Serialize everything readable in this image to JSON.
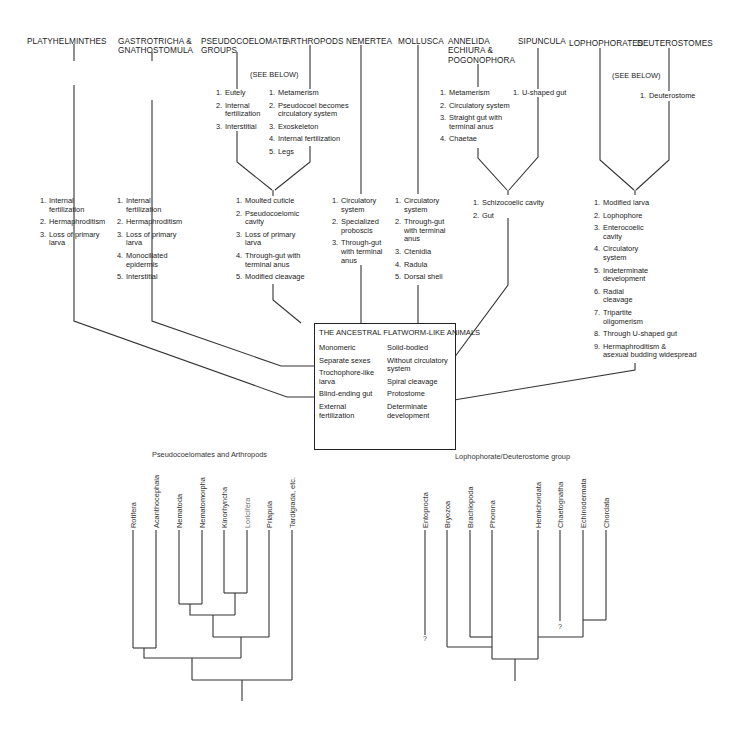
{
  "headers": {
    "platyhelminthes": "PLATYHELMINTHES",
    "gastrotricha": "GASTROTRICHA &\nGNATHOSTOMULA",
    "pseudocoelomate": "PSEUDOCOELOMATE\nGROUPS",
    "arthropods": "ARTHROPODS",
    "nemertea": "NEMERTEA",
    "mollusca": "MOLLUSCA",
    "annelida": "ANNELIDA\nECHIURA &\nPOGONOPHORA",
    "sipuncula": "SIPUNCULA",
    "lophophorates": "LOPHOPHORATES",
    "deuterostomes": "DEUTEROSTOMES"
  },
  "see_below_1": "(SEE BELOW)",
  "see_below_2": "(SEE BELOW)",
  "lists": {
    "pseudocoelomate": [
      "Eutely",
      "Internal\nfertilization",
      "Interstitial"
    ],
    "arthropods": [
      "Metamerism",
      "Pseudocoel becomes\ncirculatory system",
      "Exoskeleton",
      "Internal fertilization",
      "Legs"
    ],
    "annelida": [
      "Metamerism",
      "Circulatory system",
      "Straight gut with\nterminal anus",
      "Chaetae"
    ],
    "sipuncula": [
      "U-shaped gut"
    ],
    "deuterostomes": [
      "Deuterostome"
    ],
    "platyhelminthes": [
      "Internal\nfertilization",
      "Hermaphroditism",
      "Loss of primary\nlarva"
    ],
    "gastrotricha": [
      "Internal\nfertilization",
      "Hermaphroditism",
      "Loss of primary\nlarva",
      "Monociliated\nepidermis",
      "Interstitial"
    ],
    "pseudo_arthro_joint": [
      "Moulted cuticle",
      "Pseudocoelomic\ncavity",
      "Loss of primary\nlarva",
      "Through-gut with\nterminal anus",
      "Modified cleavage"
    ],
    "nemertea": [
      "Circulatory\nsystem",
      "Specialized\nproboscis",
      "Through-gut\nwith terminal\nanus"
    ],
    "mollusca": [
      "Circulatory\nsystem",
      "Through-gut\nwith terminal\nanus",
      "Ctenidia",
      "Radula",
      "Dorsal shell"
    ],
    "annelid_sipuncula_joint": [
      "Schizocoelic cavity",
      "Gut"
    ],
    "lopho_deutero_joint": [
      "Modified larva",
      "Lophophore",
      "Enterocoelic\ncavity",
      "Circulatory\nsystem",
      "Indeterminate\ndevelopment",
      "Radial\ncleavage",
      "Tripartite\noligomerism",
      "Through U-shaped gut",
      "Hermaphroditism &\nasexual budding widespread"
    ]
  },
  "ancestral_box": {
    "title": "THE ANCESTRAL FLATWORM-LIKE ANIMALS",
    "left": [
      "Monomeric",
      "Separate sexes",
      "Trochophore-like\nlarva",
      "Blind-ending gut",
      "External\nfertilization"
    ],
    "right": [
      "Solid-bodied",
      "Without circulatory\nsystem",
      "Spiral cleavage",
      "Protostome",
      "Determinate\ndevelopment"
    ]
  },
  "cladogram_left": {
    "caption": "Pseudocoelomates and Arthropods",
    "taxa": [
      "Rotifera",
      "Acanthocephala",
      "Nematoda",
      "Nematomorpha",
      "Kinorhyncha",
      "Loricifera",
      "Priapula",
      "Tardigrada, etc."
    ]
  },
  "cladogram_right": {
    "caption": "Lophophorate/Deuterostome group",
    "taxa": [
      "Entoprocta",
      "Bryozoa",
      "Brachiopoda",
      "Phorona",
      "Hemichordata",
      "Chaetognatha",
      "Echinodermata",
      "Chordata"
    ],
    "uncertain_marks": [
      "?",
      "?"
    ]
  }
}
